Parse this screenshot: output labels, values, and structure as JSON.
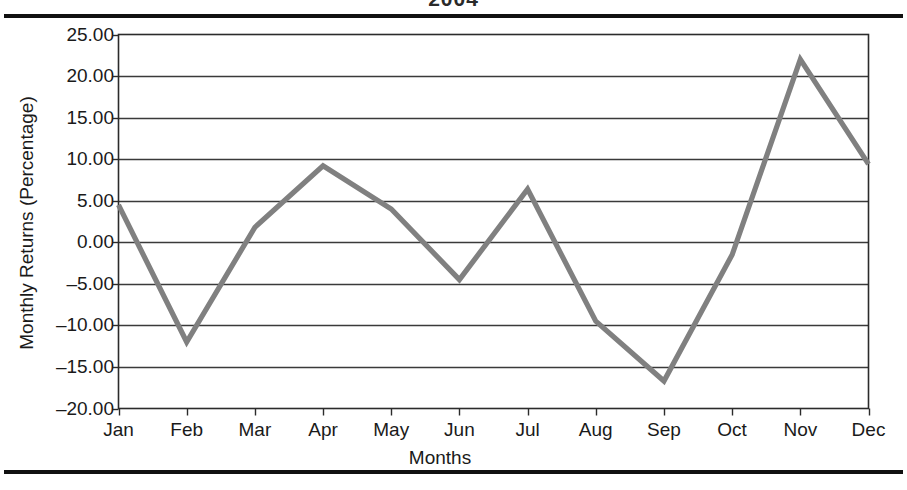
{
  "chart_data": {
    "type": "line",
    "title": "2004",
    "xlabel": "Months",
    "ylabel": "Monthly Returns (Percentage)",
    "categories": [
      "Jan",
      "Feb",
      "Mar",
      "Apr",
      "May",
      "Jun",
      "Jul",
      "Aug",
      "Sep",
      "Oct",
      "Nov",
      "Dec"
    ],
    "values": [
      4.5,
      -12.0,
      1.8,
      9.2,
      4.0,
      -4.5,
      6.4,
      -9.5,
      -16.7,
      -1.5,
      22.0,
      9.4
    ],
    "series": [
      {
        "name": "Monthly Returns",
        "values": [
          4.5,
          -12.0,
          1.8,
          9.2,
          4.0,
          -4.5,
          6.4,
          -9.5,
          -16.7,
          -1.5,
          22.0,
          9.4
        ]
      }
    ],
    "ylim": [
      -20.0,
      25.0
    ],
    "ytick_labels": [
      "25.00",
      "20.00",
      "15.00",
      "10.00",
      "5.00",
      "0.00",
      "–15.00",
      "–20.00"
    ],
    "yticks": [
      25,
      20,
      15,
      10,
      5,
      0,
      -5,
      -10,
      -15,
      -20
    ],
    "ytick_labels_full": [
      "25.00",
      "20.00",
      "15.00",
      "10.00",
      "5.00",
      "0.00",
      "–5.00",
      "–10.00",
      "–15.00",
      "–20.00"
    ],
    "grid": true,
    "legend": false,
    "line_color": "#808080",
    "grid_color": "#3a3a3a",
    "frame_color": "#2b2b2b",
    "rule_color": "#111111"
  }
}
